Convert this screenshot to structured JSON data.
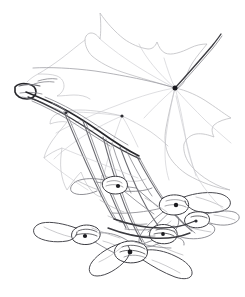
{
  "artwork": {
    "title": "Maple branch with leaves and samaras",
    "medium": "pencil line drawing",
    "subject": "Acer (maple) twig bearing one large palmate leaf, a second partly drawn leaf, and a pendulous cluster of paired winged samaras",
    "background_color": "#ffffff",
    "ink_color": "#1b1b1f",
    "faint_line_color": "#c3c3c7",
    "width_px": 245,
    "height_px": 297,
    "visible_text": ""
  },
  "elements": {
    "main_leaf": {
      "name": "upper palmate maple leaf",
      "vein_node": {
        "x": 175,
        "y": 88
      },
      "lobe_count": 5,
      "line_weight": "very light gray",
      "lobe_tips": [
        {
          "x": 100,
          "y": 13
        },
        {
          "x": 157,
          "y": 42
        },
        {
          "x": 207,
          "y": 44
        },
        {
          "x": 231,
          "y": 118
        },
        {
          "x": 230,
          "y": 190
        }
      ]
    },
    "second_leaf": {
      "name": "lower-left partly drawn leaf",
      "vein_node": {
        "x": 122,
        "y": 116
      },
      "lobe_count": 5,
      "line_weight": "very light gray"
    },
    "branch": {
      "name": "woody twig",
      "start": {
        "x": 18,
        "y": 90
      },
      "end": {
        "x": 150,
        "y": 150
      },
      "line_weight": "dark",
      "terminal_bud": {
        "x": 22,
        "y": 92
      }
    },
    "samara_cluster": {
      "name": "pendulous cluster of winged samaras",
      "seed_node_count": 6,
      "wing_count": 13,
      "nodes": [
        {
          "x": 118,
          "y": 186
        },
        {
          "x": 176,
          "y": 205
        },
        {
          "x": 85,
          "y": 236
        },
        {
          "x": 130,
          "y": 252
        },
        {
          "x": 163,
          "y": 234
        },
        {
          "x": 196,
          "y": 221
        }
      ]
    }
  },
  "palette": {
    "paper": "#ffffff",
    "darkest_ink": "#1b1b1f",
    "stem_gray": "#6a6a70",
    "wing_gray": "#7c7c83",
    "blade_gray": "#c3c3c7"
  }
}
